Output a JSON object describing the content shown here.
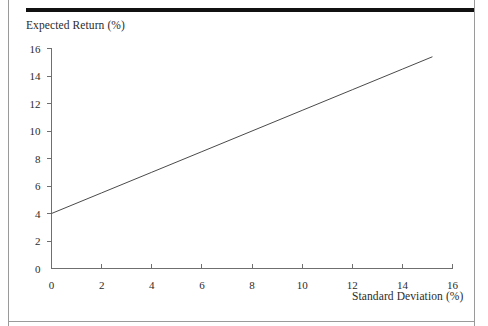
{
  "figure": {
    "background_color": "#ffffff",
    "frame": {
      "left_rule_color": "#9a9a9a",
      "right_rule_color": "#9a9a9a",
      "top_bar_color": "#111111",
      "bottom_rule_color": "#9a9a9a"
    }
  },
  "chart_data": {
    "type": "line",
    "title": "",
    "subtitle": "",
    "xlabel": "Standard Deviation (%)",
    "ylabel": "Expected Return (%)",
    "xlim": [
      0,
      16
    ],
    "ylim": [
      0,
      16
    ],
    "xticks": [
      0,
      2,
      4,
      6,
      8,
      10,
      12,
      14,
      16
    ],
    "xtick_labels": [
      "0",
      "2",
      "4",
      "6",
      "8",
      "10",
      "12",
      "14",
      "16"
    ],
    "yticks": [
      0,
      2,
      4,
      6,
      8,
      10,
      12,
      14,
      16
    ],
    "ytick_labels": [
      "0",
      "2",
      "4",
      "6",
      "8",
      "10",
      "12",
      "14",
      "16"
    ],
    "grid": false,
    "legend": null,
    "legend_position": "none",
    "annotations": [],
    "series": [
      {
        "name": "Capital Market Line",
        "color": "#4a4a4a",
        "line_width": 1,
        "intercept": 4.0,
        "slope": 0.75,
        "x": [
          0,
          15.2
        ],
        "y": [
          4.0,
          15.4
        ],
        "points": [
          {
            "x": 0,
            "y": 4.0
          },
          {
            "x": 2,
            "y": 5.5
          },
          {
            "x": 4,
            "y": 7.0
          },
          {
            "x": 6,
            "y": 8.5
          },
          {
            "x": 8,
            "y": 10.0
          },
          {
            "x": 10,
            "y": 11.5
          },
          {
            "x": 12,
            "y": 13.0
          },
          {
            "x": 14,
            "y": 14.5
          },
          {
            "x": 15.2,
            "y": 15.4
          }
        ]
      }
    ],
    "axis_color": "#6f6f6f"
  }
}
